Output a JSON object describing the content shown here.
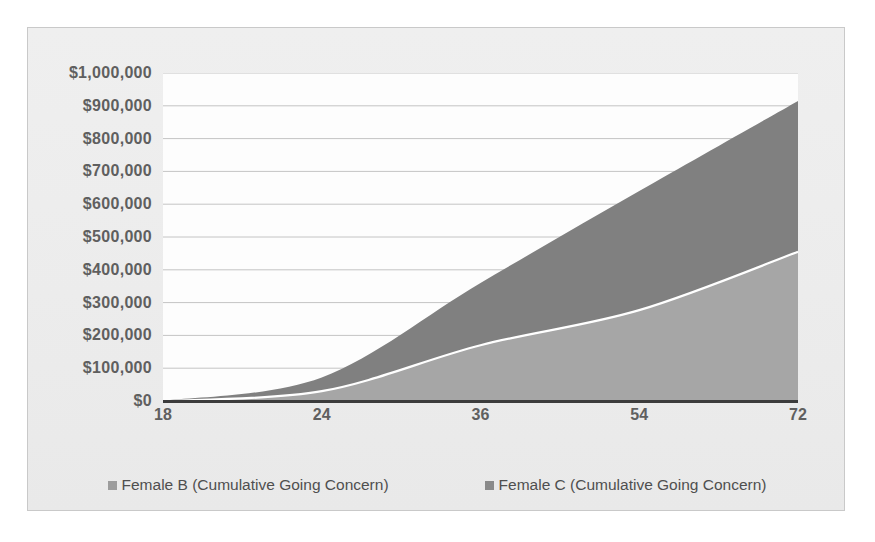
{
  "chart_data": {
    "type": "area",
    "title": "",
    "subtitle": "",
    "xlabel": "",
    "ylabel": "",
    "grid": true,
    "legend_position": "bottom",
    "x": [
      18,
      24,
      36,
      54,
      72
    ],
    "categories": [
      "18",
      "24",
      "36",
      "54",
      "72"
    ],
    "xtick_labels": [
      "18",
      "24",
      "36",
      "54",
      "72"
    ],
    "ytick_labels": [
      "$1,000,000",
      "$900,000",
      "$800,000",
      "$700,000",
      "$600,000",
      "$500,000",
      "$400,000",
      "$300,000",
      "$200,000",
      "$100,000",
      "$0"
    ],
    "ytick_values": [
      1000000,
      900000,
      800000,
      700000,
      600000,
      500000,
      400000,
      300000,
      200000,
      100000,
      0
    ],
    "ylim": [
      0,
      1000000
    ],
    "series": [
      {
        "name": "Female C (Cumulative Going Concern)",
        "color": "#808080",
        "values": [
          0,
          72000,
          360000,
          640000,
          915000
        ]
      },
      {
        "name": "Female B (Cumulative Going Concern)",
        "color": "#a6a6a6",
        "values": [
          0,
          30000,
          170000,
          277000,
          455000
        ]
      }
    ]
  },
  "legend": {
    "entries": [
      {
        "label": "Female B (Cumulative Going Concern)",
        "color": "#9c9c9c"
      },
      {
        "label": "Female C (Cumulative Going Concern)",
        "color": "#8a8a8a"
      }
    ]
  },
  "colors": {
    "series_female_b": "#a6a6a6",
    "series_female_c": "#808080",
    "boundary_line": "#ffffff",
    "axis_line": "#3c3c3c",
    "gridline": "#c4c4c4",
    "tick_text": "#5f5f5f",
    "legend_text": "#4f4f4f",
    "panel_background": "#eeeeee",
    "plot_background": "#fdfdfd",
    "frame_border": "#c9c9c9"
  }
}
